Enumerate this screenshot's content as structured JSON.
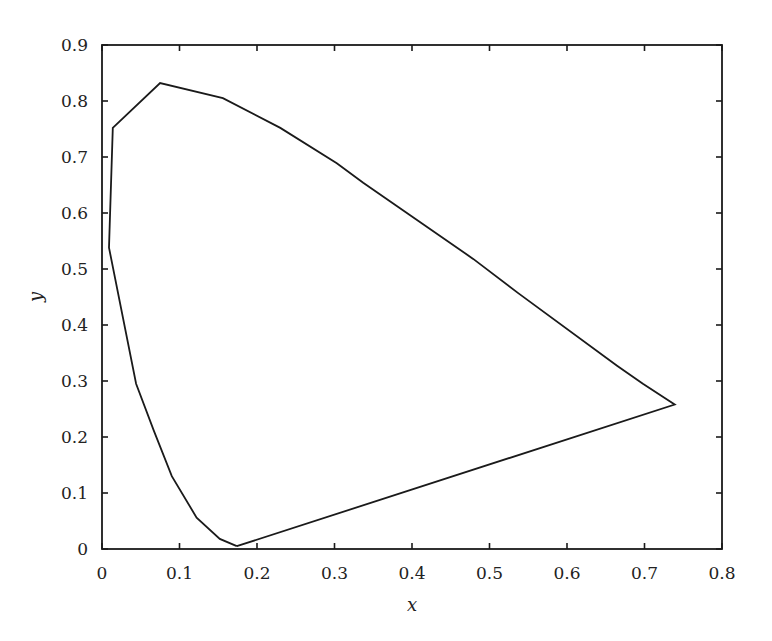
{
  "chart_data": {
    "type": "line",
    "title": "",
    "xlabel": "x",
    "ylabel": "y",
    "xlim": [
      0,
      0.8
    ],
    "ylim": [
      0,
      0.9
    ],
    "grid": false,
    "legend": null,
    "xticks": [
      "0",
      "0.1",
      "0.2",
      "0.3",
      "0.4",
      "0.5",
      "0.6",
      "0.7",
      "0.8"
    ],
    "yticks": [
      "0",
      "0.1",
      "0.2",
      "0.3",
      "0.4",
      "0.5",
      "0.6",
      "0.7",
      "0.8",
      "0.9"
    ],
    "series": [
      {
        "name": "chromaticity locus",
        "closed": true,
        "color": "#1a1a1a",
        "x": [
          0.174,
          0.152,
          0.122,
          0.09,
          0.067,
          0.044,
          0.009,
          0.014,
          0.075,
          0.156,
          0.23,
          0.303,
          0.337,
          0.479,
          0.537,
          0.665,
          0.698,
          0.739,
          0.174
        ],
        "y": [
          0.005,
          0.018,
          0.056,
          0.13,
          0.211,
          0.295,
          0.538,
          0.752,
          0.832,
          0.805,
          0.752,
          0.689,
          0.654,
          0.518,
          0.457,
          0.327,
          0.295,
          0.258,
          0.005
        ]
      }
    ]
  },
  "layout": {
    "plot_left": 102,
    "plot_right": 722,
    "plot_top": 45,
    "plot_bottom": 549,
    "tick_length": 6
  }
}
